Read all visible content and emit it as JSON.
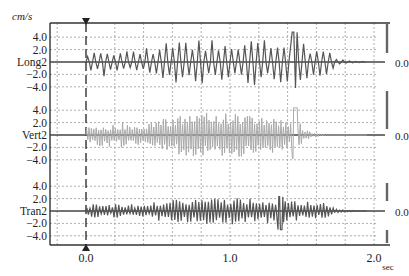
{
  "chart_data": {
    "type": "line",
    "title": "",
    "unit_label": "cm/s",
    "xlabel": "sec",
    "x_ticks": [
      "0.0",
      "1.0",
      "2.0"
    ],
    "x_range": [
      -0.2,
      2.0
    ],
    "grid": "dotted, every 0.2 s horizontally and every 2.0 cm/s vertically",
    "event_marker_time": 0.0,
    "series": [
      {
        "name": "Long2",
        "color": "#555555",
        "y_ticks": [
          "4.0",
          "2.0",
          "Long2",
          "-2.0",
          "-4.0"
        ],
        "ylim": [
          -5,
          5
        ],
        "right_label": "0.0",
        "peak_positive": 4.8,
        "peak_negative": -4.2,
        "strong_motion_window": [
          0.0,
          1.7
        ],
        "max_at_time": 1.45
      },
      {
        "name": "Vert2",
        "color": "#aaaaaa",
        "y_ticks": [
          "4.0",
          "2.0",
          "Vert2",
          "-2.0",
          "-4.0"
        ],
        "ylim": [
          -5,
          5
        ],
        "right_label": "0.0",
        "peak_positive": 4.4,
        "peak_negative": -3.8,
        "strong_motion_window": [
          0.0,
          1.5
        ],
        "max_at_time": 1.45
      },
      {
        "name": "Tran2",
        "color": "#555555",
        "y_ticks": [
          "4.0",
          "2.0",
          "Tran2",
          "-2.0",
          "-4.0"
        ],
        "ylim": [
          -5,
          5
        ],
        "right_label": "0.0",
        "peak_positive": 2.3,
        "peak_negative": -3.0,
        "strong_motion_window": [
          0.0,
          1.7
        ],
        "max_at_time": 1.35
      }
    ]
  }
}
